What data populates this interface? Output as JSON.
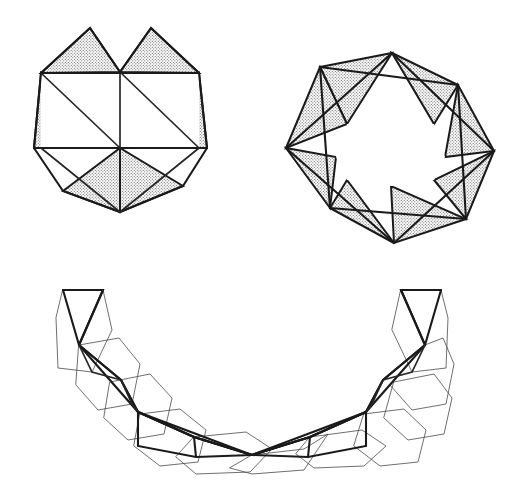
{
  "plate": {
    "title": "Polyhedral net figures plate",
    "width": 526,
    "height": 501,
    "background_color": "#ffffff",
    "figure_count": 3
  },
  "style": {
    "ink_color": "#1a1a1a",
    "thin_ink_color": "#4a4a4a",
    "shade_fill_color": "#d4d4d4",
    "shade_dot_color": "#6e6e6e",
    "paper_color": "#ffffff",
    "heavy_stroke_width": 2.1,
    "thin_stroke_width": 0.8
  },
  "figures": [
    {
      "id": "figure-hexagonal-antiprism-net",
      "label": "hexagonal rosette net",
      "position": "top-left",
      "description": "Inner hexagon subdivided into triangles with six stippled triangles folded outward around the rim",
      "bbox": [
        34,
        26,
        180,
        190
      ],
      "inner_hexagon": [
        [
          41,
          73
        ],
        [
          120,
          72
        ],
        [
          199,
          73
        ],
        [
          199,
          148
        ],
        [
          120,
          148
        ],
        [
          41,
          148
        ]
      ],
      "inner_edges": [
        [
          [
            41,
            73
          ],
          [
            120,
            148
          ]
        ],
        [
          [
            120,
            72
          ],
          [
            120,
            148
          ]
        ],
        [
          [
            120,
            72
          ],
          [
            199,
            148
          ]
        ],
        [
          [
            41,
            148
          ],
          [
            199,
            148
          ]
        ],
        [
          [
            41,
            73
          ],
          [
            199,
            73
          ]
        ]
      ],
      "shaded_triangles": [
        {
          "name": "top-left-flap",
          "points": [
            [
              41,
              73
            ],
            [
              120,
              72
            ],
            [
              90,
              28
            ]
          ]
        },
        {
          "name": "top-right-flap",
          "points": [
            [
              120,
              72
            ],
            [
              199,
              73
            ],
            [
              150,
              28
            ]
          ]
        },
        {
          "name": "left-flap",
          "points": [
            [
              41,
              73
            ],
            [
              41,
              148
            ],
            [
              120,
              148
            ]
          ]
        },
        {
          "name": "right-flap",
          "points": [
            [
              199,
              73
            ],
            [
              199,
              148
            ],
            [
              120,
              148
            ]
          ]
        },
        {
          "name": "bottom-left-flap",
          "points": [
            [
              41,
              148
            ],
            [
              120,
              148
            ],
            [
              63,
              191
            ]
          ]
        },
        {
          "name": "bottom-right-flap",
          "points": [
            [
              120,
              148
            ],
            [
              199,
              148
            ],
            [
              189,
              186
            ]
          ]
        },
        {
          "name": "bottom-center-left",
          "points": [
            [
              41,
              148
            ],
            [
              63,
              191
            ],
            [
              120,
              212
            ]
          ]
        },
        {
          "name": "bottom-center-right",
          "points": [
            [
              199,
              148
            ],
            [
              189,
              186
            ],
            [
              120,
              212
            ]
          ]
        }
      ]
    },
    {
      "id": "figure-octagonal-star-net",
      "label": "eight-point star rosette net",
      "position": "top-right",
      "description": "Regular octagon ring with eight stippled triangles projecting outward and crossing chords inside",
      "bbox": [
        283,
        28,
        213,
        220
      ],
      "center": [
        390,
        138
      ],
      "outer_radius": 107,
      "inner_radius": 75,
      "point_count": 8,
      "rotation_offset_deg": 11,
      "inner_polygon_chords": true
    },
    {
      "id": "figure-folded-hexagon-chain",
      "label": "folded chain of hexagons",
      "position": "bottom",
      "description": "A U-shaped chain of outlined hexagons overlaid with a bold zig-zag triangle strip, unshaded",
      "bbox": [
        55,
        283,
        400,
        192
      ],
      "chain_vertices_upper": [
        [
          63,
          290
        ],
        [
          103,
          290
        ],
        [
          79,
          345
        ],
        [
          121,
          380
        ],
        [
          138,
          412
        ],
        [
          194,
          437
        ],
        [
          252,
          455
        ],
        [
          310,
          437
        ],
        [
          366,
          412
        ],
        [
          383,
          380
        ],
        [
          425,
          345
        ],
        [
          401,
          290
        ],
        [
          441,
          290
        ]
      ],
      "chain_vertices_lower": [
        [
          79,
          345
        ],
        [
          138,
          412
        ],
        [
          194,
          437
        ],
        [
          252,
          455
        ],
        [
          310,
          437
        ],
        [
          366,
          412
        ],
        [
          425,
          345
        ]
      ],
      "hexagon_outline_count": 11,
      "has_shading": false
    }
  ],
  "shading": {
    "pattern_name": "fine-stipple",
    "tile_size": 3,
    "dot_radius": 0.55,
    "apparent_gray": "#d6d6d6"
  }
}
